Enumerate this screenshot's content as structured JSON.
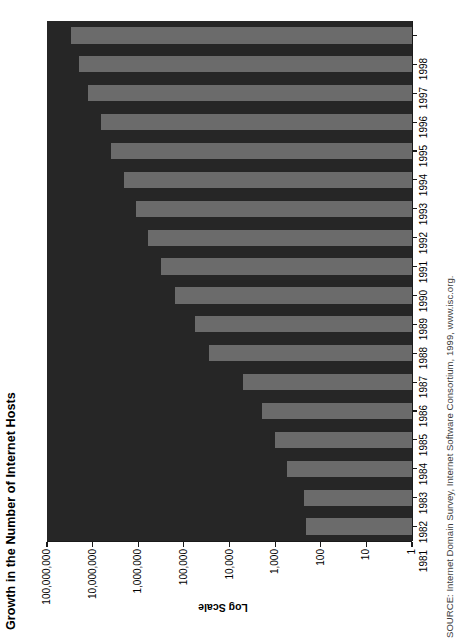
{
  "chart_data": {
    "type": "bar",
    "orientation": "horizontal",
    "title": "Growth in the Number of Internet Hosts",
    "source": "SOURCE: Internet Domain Survey, Internet Software Consortium, 1999, www.isc.org.",
    "xlabel": "Log Scale",
    "ylabel": "",
    "scale": "log",
    "grid": false,
    "legend": null,
    "axis_colors": {
      "background": "#ffffff",
      "plot_background": "#262626",
      "bar": "#6b6b6b",
      "axis_line": "#1a1a1a",
      "text": "#000000"
    },
    "value_axis": {
      "label": "Log Scale",
      "ticks": [
        1,
        10,
        100,
        1000,
        10000,
        100000,
        1000000,
        10000000,
        100000000
      ],
      "tick_labels": [
        "1",
        "10",
        "100",
        "1,000",
        "10,000",
        "100,000",
        "1,000,000",
        "10,000,000",
        "100,000,000"
      ],
      "min": 1,
      "max": 100000000,
      "direction": "right-to-left"
    },
    "categories": [
      "1981",
      "1982",
      "1983",
      "1984",
      "1985",
      "1986",
      "1987",
      "1988",
      "1989",
      "1990",
      "1991",
      "1992",
      "1993",
      "1994",
      "1995",
      "1996",
      "1997",
      "1998"
    ],
    "values": [
      213,
      235,
      562,
      1024,
      1961,
      5089,
      28174,
      56000,
      159000,
      313000,
      617000,
      1136000,
      2056000,
      3864000,
      6642000,
      12881000,
      19540000,
      29670000
    ],
    "bars": [
      {
        "year": "1981",
        "value": 213
      },
      {
        "year": "1982",
        "value": 235
      },
      {
        "year": "1983",
        "value": 562
      },
      {
        "year": "1984",
        "value": 1024
      },
      {
        "year": "1985",
        "value": 1961
      },
      {
        "year": "1986",
        "value": 5089
      },
      {
        "year": "1987",
        "value": 28174
      },
      {
        "year": "1988",
        "value": 56000
      },
      {
        "year": "1989",
        "value": 159000
      },
      {
        "year": "1990",
        "value": 313000
      },
      {
        "year": "1991",
        "value": 617000
      },
      {
        "year": "1992",
        "value": 1136000
      },
      {
        "year": "1993",
        "value": 2056000
      },
      {
        "year": "1994",
        "value": 3864000
      },
      {
        "year": "1995",
        "value": 6642000
      },
      {
        "year": "1996",
        "value": 12881000
      },
      {
        "year": "1997",
        "value": 19540000
      },
      {
        "year": "1998",
        "value": 29670000
      }
    ]
  }
}
